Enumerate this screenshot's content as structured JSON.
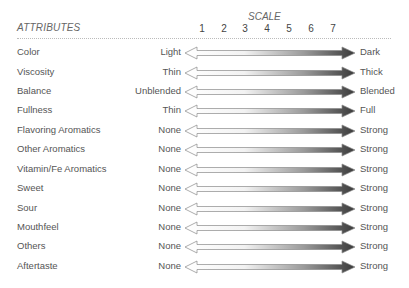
{
  "header": {
    "attributes_label": "ATTRIBUTES",
    "scale_label": "SCALE",
    "scale_ticks": [
      "1",
      "2",
      "3",
      "4",
      "5",
      "6",
      "7"
    ]
  },
  "rows": [
    {
      "name": "Color",
      "low": "Light",
      "high": "Dark"
    },
    {
      "name": "Viscosity",
      "low": "Thin",
      "high": "Thick"
    },
    {
      "name": "Balance",
      "low": "Unblended",
      "high": "Blended"
    },
    {
      "name": "Fullness",
      "low": "Thin",
      "high": "Full"
    },
    {
      "name": "Flavoring Aromatics",
      "low": "None",
      "high": "Strong"
    },
    {
      "name": "Other Aromatics",
      "low": "None",
      "high": "Strong"
    },
    {
      "name": "Vitamin/Fe Aromatics",
      "low": "None",
      "high": "Strong"
    },
    {
      "name": "Sweet",
      "low": "None",
      "high": "Strong"
    },
    {
      "name": "Sour",
      "low": "None",
      "high": "Strong"
    },
    {
      "name": "Mouthfeel",
      "low": "None",
      "high": "Strong"
    },
    {
      "name": "Others",
      "low": "None",
      "high": "Strong"
    },
    {
      "name": "Aftertaste",
      "low": "None",
      "high": "Strong"
    }
  ],
  "colors": {
    "arrow_light": "#ffffff",
    "arrow_dark": "#444444",
    "outline": "#888888"
  }
}
